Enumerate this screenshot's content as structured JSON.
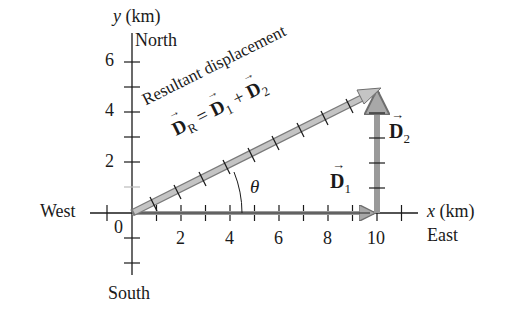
{
  "diagram": {
    "y_axis": {
      "label_var": "y",
      "label_unit": "(km)",
      "direction_top": "North",
      "direction_bottom": "South",
      "ticks": [
        "2",
        "4",
        "6"
      ]
    },
    "x_axis": {
      "label_var": "x",
      "label_unit": "(km)",
      "direction_right": "East",
      "direction_left": "West",
      "ticks": [
        "0",
        "2",
        "4",
        "6",
        "8",
        "10"
      ]
    },
    "vectors": {
      "D1": {
        "symbol": "D",
        "subscript": "1",
        "from": [
          0,
          0
        ],
        "to": [
          10,
          0
        ]
      },
      "D2": {
        "symbol": "D",
        "subscript": "2",
        "from": [
          10,
          0
        ],
        "to": [
          10,
          5
        ]
      },
      "DR": {
        "symbol": "D",
        "subscript": "R",
        "from": [
          0,
          0
        ],
        "to": [
          10,
          5
        ]
      }
    },
    "resultant_label": "Resultant displacement",
    "equation": {
      "lhs_sub": "R",
      "eq": "=",
      "t1_sub": "1",
      "plus": "+",
      "t2_sub": "2"
    },
    "angle_label": "θ",
    "colors": {
      "vector_fill": "#b8b8b8",
      "vector_edge": "#7a7a7a",
      "axis": "#1a1a1a"
    }
  }
}
